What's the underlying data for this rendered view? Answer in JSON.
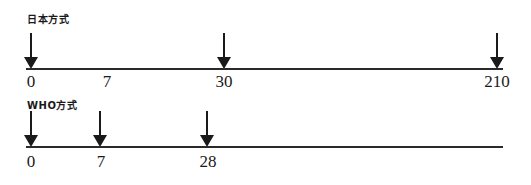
{
  "diagram": {
    "schedules": [
      {
        "title": "日本方式",
        "axis_end_day": 210,
        "doses": [
          {
            "day": "0",
            "x": 31,
            "label_x": 31
          },
          {
            "day": "7",
            "x": null,
            "label_x": 107
          },
          {
            "day": "30",
            "x": 224,
            "label_x": 224
          },
          {
            "day": "210",
            "x": 497,
            "label_x": 497
          }
        ],
        "labels": [
          "0",
          "7",
          "30",
          "210"
        ],
        "arrow_days": [
          "0",
          "30",
          "210"
        ]
      },
      {
        "title": "WHO方式",
        "axis_end_day": 28,
        "doses": [
          {
            "day": "0",
            "x": 31
          },
          {
            "day": "7",
            "x": 100
          },
          {
            "day": "28",
            "x": 207
          }
        ],
        "labels": [
          "0",
          "7",
          "28"
        ],
        "arrow_days": [
          "0",
          "7",
          "28"
        ]
      }
    ]
  },
  "colors": {
    "line": "#2a2a2a",
    "text": "#1a1a1a",
    "background": "#ffffff"
  }
}
